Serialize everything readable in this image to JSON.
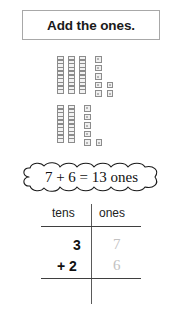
{
  "title": {
    "text": "Add the ones."
  },
  "blocks": {
    "addend1": {
      "tens_rods": 3,
      "rod_cells": 10,
      "ones_units": 7,
      "ones_rows": [
        1,
        1,
        1,
        2,
        2
      ]
    },
    "addend2": {
      "tens_rods": 2,
      "rod_cells": 10,
      "ones_units": 6,
      "ones_rows": [
        1,
        1,
        1,
        1,
        2
      ]
    }
  },
  "equation": {
    "text": "7 + 6 = 13 ones",
    "addend_ones_1": 7,
    "addend_ones_2": 6,
    "sum_ones": 13,
    "unit_label": "ones"
  },
  "place_value_table": {
    "headers": {
      "tens": "tens",
      "ones": "ones"
    },
    "rows": {
      "top": {
        "tens": "3",
        "ones": "7"
      },
      "bottom": {
        "operator": "+",
        "tens": "2",
        "ones": "6"
      }
    }
  },
  "colors": {
    "title_border": "#a8a8a8",
    "block_border": "#8c8c8c",
    "block_fill": "#f2f2f2",
    "rule": "#3f3f3f",
    "faded_digit": "#c2c2c2",
    "text": "#111111"
  }
}
